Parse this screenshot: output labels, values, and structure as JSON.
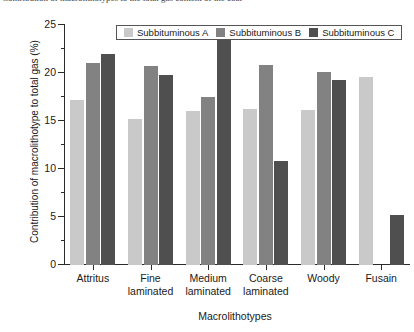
{
  "top_caption": {
    "text": "Contribution of macrolithotypes to the total gas content of the coal"
  },
  "legend": {
    "position": "top-center",
    "entries": [
      {
        "label": "Subbituminous A",
        "color": "#c9c9c9"
      },
      {
        "label": "Subbituminous B",
        "color": "#828282"
      },
      {
        "label": "Subbituminous C",
        "color": "#4f4f4f"
      }
    ]
  },
  "chart_data": {
    "type": "bar",
    "title": "",
    "xlabel": "Macrolithotypes",
    "ylabel": "Contribution of macrolithotype to total gas (%)",
    "categories": [
      "Attritus",
      "Fine laminated",
      "Medium laminated",
      "Coarse laminated",
      "Woody",
      "Fusain"
    ],
    "category_lines": [
      [
        "Attritus",
        ""
      ],
      [
        "Fine",
        "laminated"
      ],
      [
        "Medium",
        "laminated"
      ],
      [
        "Coarse",
        "laminated"
      ],
      [
        "Woody",
        ""
      ],
      [
        "Fusain",
        ""
      ]
    ],
    "series": [
      {
        "name": "Subbituminous A",
        "color": "#c9c9c9",
        "values": [
          17.2,
          15.2,
          16.0,
          16.2,
          16.1,
          19.6
        ]
      },
      {
        "name": "Subbituminous B",
        "color": "#828282",
        "values": [
          21.0,
          20.7,
          17.5,
          20.8,
          20.1,
          0
        ]
      },
      {
        "name": "Subbituminous C",
        "color": "#4f4f4f",
        "values": [
          22.0,
          19.8,
          23.4,
          10.8,
          19.3,
          5.2
        ]
      }
    ],
    "ylim": [
      0,
      25
    ],
    "yticks": [
      0,
      5,
      10,
      15,
      20,
      25
    ],
    "yticks_minor": [
      2.5,
      7.5,
      12.5,
      17.5,
      22.5
    ],
    "ytick_labels": [
      "0",
      "5",
      "10",
      "15",
      "20",
      "25"
    ],
    "grid": false,
    "legend_position": "top-center"
  }
}
